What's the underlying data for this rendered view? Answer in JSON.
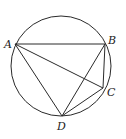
{
  "diagram": {
    "type": "circle-inscribed-quadrilateral",
    "circle": {
      "cx": 61,
      "cy": 66,
      "r": 50
    },
    "points": {
      "A": {
        "x": 15,
        "y": 44,
        "label": "A",
        "lx": 4,
        "ly": 48
      },
      "B": {
        "x": 105,
        "y": 44,
        "label": "B",
        "lx": 108,
        "ly": 44
      },
      "C": {
        "x": 103,
        "y": 88,
        "label": "C",
        "lx": 107,
        "ly": 96
      },
      "D": {
        "x": 62,
        "y": 116,
        "label": "D",
        "lx": 57,
        "ly": 130
      }
    },
    "segments": [
      [
        "A",
        "B"
      ],
      [
        "A",
        "C"
      ],
      [
        "A",
        "D"
      ],
      [
        "B",
        "C"
      ],
      [
        "B",
        "D"
      ],
      [
        "C",
        "D"
      ]
    ],
    "stroke_color": "#2a2a2a"
  }
}
